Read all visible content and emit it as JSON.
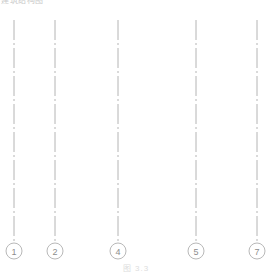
{
  "figure": {
    "corner_note": "建筑结构图",
    "caption": "图 3.3",
    "canvas": {
      "width": 272,
      "height": 276
    },
    "colors": {
      "background": "#ffffff",
      "grid_line": "#b4b4b4",
      "bubble_stroke": "#b0b0b0",
      "bubble_text": "#8d8d8d",
      "caption_text": "#dddddd"
    },
    "line_style": {
      "type": "dash-dot",
      "dasharray": "20 3 2 3",
      "width": 1
    },
    "axes": [
      {
        "label": "1",
        "x": 14,
        "y_top": 20,
        "y_bottom": 242,
        "bubble_cy": 251,
        "bubble_r": 8
      },
      {
        "label": "2",
        "x": 55,
        "y_top": 20,
        "y_bottom": 242,
        "bubble_cy": 251,
        "bubble_r": 8
      },
      {
        "label": "4",
        "x": 118,
        "y_top": 20,
        "y_bottom": 242,
        "bubble_cy": 251,
        "bubble_r": 8
      },
      {
        "label": "5",
        "x": 196,
        "y_top": 20,
        "y_bottom": 242,
        "bubble_cy": 251,
        "bubble_r": 8
      },
      {
        "label": "7",
        "x": 257,
        "y_top": 20,
        "y_bottom": 242,
        "bubble_cy": 251,
        "bubble_r": 8
      }
    ]
  }
}
